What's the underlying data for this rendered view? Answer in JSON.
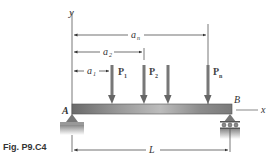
{
  "figure": {
    "caption": "Fig. P9.C4",
    "axes": {
      "y_label": "y",
      "x_label": "x"
    },
    "supports": {
      "left": "A",
      "right": "B"
    },
    "dimensions": {
      "a_n": "a",
      "a_n_sub": "n",
      "a_2": "a",
      "a_2_sub": "2",
      "a_1": "a",
      "a_1_sub": "1",
      "length": "L"
    },
    "loads": [
      {
        "label": "P",
        "sub": "1"
      },
      {
        "label": "P",
        "sub": "2"
      },
      {
        "label": "",
        "sub": ""
      },
      {
        "label": "P",
        "sub": "n"
      }
    ]
  }
}
